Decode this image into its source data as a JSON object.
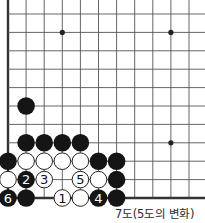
{
  "diagram": {
    "caption": "7도(5도의 변화)",
    "grid": {
      "origin_x": 8,
      "origin_y": 14,
      "spacing_x": 18.1,
      "spacing_y": 18.4,
      "cols": 12,
      "rows": 11,
      "left_edge": true,
      "bottom_edge": true,
      "line_color": "#555555",
      "edge_color": "#333333"
    },
    "star_points": [
      {
        "col": 3,
        "row": 1
      },
      {
        "col": 9,
        "row": 1
      },
      {
        "col": 9,
        "row": 7
      }
    ],
    "stones": [
      {
        "color": "black",
        "col": 1,
        "row": 5,
        "label": ""
      },
      {
        "color": "black",
        "col": 1,
        "row": 7,
        "label": ""
      },
      {
        "color": "black",
        "col": 2,
        "row": 7,
        "label": ""
      },
      {
        "color": "black",
        "col": 3,
        "row": 7,
        "label": ""
      },
      {
        "color": "black",
        "col": 4,
        "row": 7,
        "label": ""
      },
      {
        "color": "black",
        "col": 0,
        "row": 8,
        "label": ""
      },
      {
        "color": "white",
        "col": 1,
        "row": 8,
        "label": ""
      },
      {
        "color": "white",
        "col": 2,
        "row": 8,
        "label": ""
      },
      {
        "color": "white",
        "col": 3,
        "row": 8,
        "label": ""
      },
      {
        "color": "white",
        "col": 4,
        "row": 8,
        "label": ""
      },
      {
        "color": "black",
        "col": 5,
        "row": 8,
        "label": ""
      },
      {
        "color": "black",
        "col": 6,
        "row": 8,
        "label": ""
      },
      {
        "color": "white",
        "col": 0,
        "row": 9,
        "label": ""
      },
      {
        "color": "black",
        "col": 1,
        "row": 9,
        "label": "2"
      },
      {
        "color": "white",
        "col": 2,
        "row": 9,
        "label": "3"
      },
      {
        "color": "white",
        "col": 4,
        "row": 9,
        "label": "5"
      },
      {
        "color": "white",
        "col": 5,
        "row": 9,
        "label": ""
      },
      {
        "color": "black",
        "col": 6,
        "row": 9,
        "label": ""
      },
      {
        "color": "black",
        "col": 0,
        "row": 10,
        "label": "6"
      },
      {
        "color": "black",
        "col": 1,
        "row": 10,
        "label": ""
      },
      {
        "color": "white",
        "col": 3,
        "row": 10,
        "label": "1"
      },
      {
        "color": "white",
        "col": 4,
        "row": 10,
        "label": ""
      },
      {
        "color": "black",
        "col": 5,
        "row": 10,
        "label": "4"
      },
      {
        "color": "black",
        "col": 6,
        "row": 10,
        "label": ""
      }
    ]
  }
}
